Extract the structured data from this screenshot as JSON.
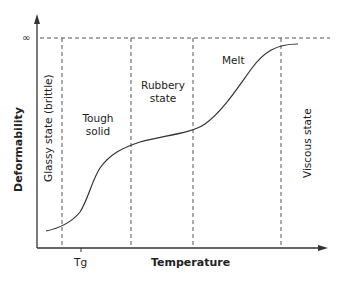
{
  "diagram": {
    "y_axis_label": "Deformability",
    "x_axis_label": "Temperature",
    "y_top_marker": "∞",
    "x_tick_label": "Tg",
    "regions": [
      {
        "label": "Glassy state (brittle)",
        "orientation": "vertical"
      },
      {
        "label_line1": "Tough",
        "label_line2": "solid"
      },
      {
        "label_line1": "Rubbery",
        "label_line2": "state"
      },
      {
        "label": "Melt"
      },
      {
        "label": "Viscous state",
        "orientation": "vertical"
      }
    ],
    "colors": {
      "line": "#333333",
      "dashed": "#555555",
      "text": "#222222"
    }
  }
}
